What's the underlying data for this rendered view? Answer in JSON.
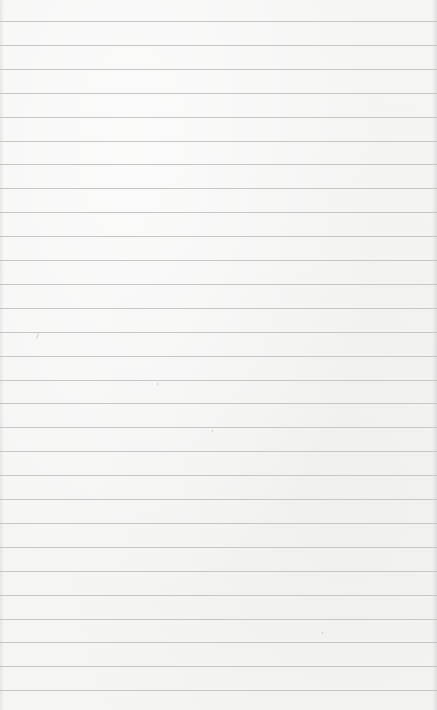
{
  "page": {
    "type": "lined-paper",
    "background_color": "#f5f5f4",
    "rule_color": "#c6c6c4",
    "rule_count": 29,
    "first_rule_y": 21,
    "rule_spacing": 23.9
  },
  "text_content": []
}
